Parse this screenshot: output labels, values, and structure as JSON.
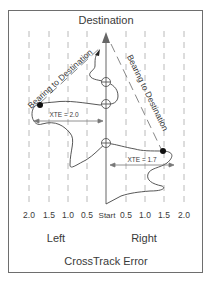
{
  "title": "Destination",
  "bearing_labels": [
    "Bearing to Destination",
    "Bearing to Destination"
  ],
  "xte_labels": {
    "left": "XTE = 2.0",
    "right": "XTE = 1.7"
  },
  "axis": {
    "ticks": [
      {
        "label": "2.0",
        "x": 29
      },
      {
        "label": "1.5",
        "x": 49
      },
      {
        "label": "1.0",
        "x": 68
      },
      {
        "label": "0.5",
        "x": 87
      },
      {
        "label": "Start",
        "x": 106
      },
      {
        "label": "0.5",
        "x": 126
      },
      {
        "label": "1.0",
        "x": 145
      },
      {
        "label": "1.5",
        "x": 164
      },
      {
        "label": "2.0",
        "x": 184
      }
    ],
    "left_label": "Left",
    "right_label": "Right",
    "title": "CrossTrack Error"
  },
  "colors": {
    "frame": "#6e6e6e",
    "line": "#555555",
    "dashed": "#9a9a9a",
    "text": "#3a3a3a",
    "dot": "#111111"
  }
}
